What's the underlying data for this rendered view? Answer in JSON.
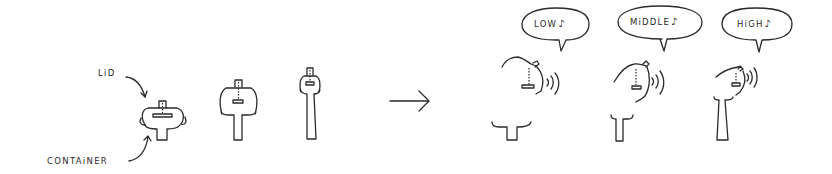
{
  "diagram": {
    "labels": {
      "lid": "LiD",
      "container": "CONTAiNER"
    },
    "stages": [
      {
        "name": "closed-wide"
      },
      {
        "name": "closed-medium"
      },
      {
        "name": "closed-narrow"
      }
    ],
    "transition_arrow": "right-arrow",
    "results": [
      {
        "pitch": "LOW",
        "note_icon": "♪"
      },
      {
        "pitch": "MiDDLE",
        "note_icon": "♪"
      },
      {
        "pitch": "HiGH",
        "note_icon": "♪"
      }
    ],
    "colors": {
      "ink": "#2a2a2a",
      "background": "#ffffff"
    }
  }
}
